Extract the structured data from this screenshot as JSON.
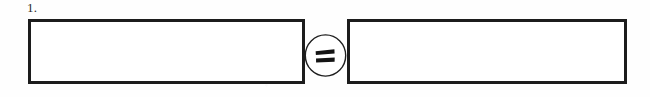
{
  "worksheet": {
    "item_number": "1.",
    "ink_color": "#1c1c1c",
    "paper_color": "#fefefe",
    "boxes": [
      {
        "name": "left-answer-box",
        "value": "",
        "placeholder": ""
      },
      {
        "name": "right-answer-box",
        "value": "",
        "placeholder": ""
      }
    ],
    "operator": {
      "icon": "equals-icon",
      "symbol": "=",
      "enclosure": "circle"
    }
  }
}
